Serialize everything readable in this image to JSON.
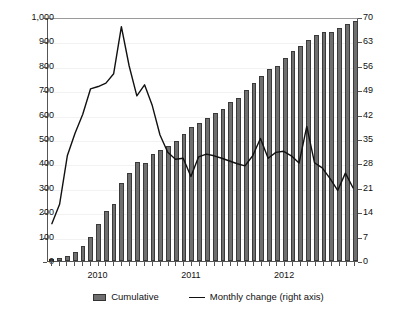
{
  "chart_data": {
    "type": "bar",
    "title": "",
    "subtitle": "",
    "xlabel": "",
    "ylabel": "",
    "y2label": "",
    "grid": true,
    "legend_position": "bottom",
    "ylim": [
      0,
      1000
    ],
    "y2lim": [
      0,
      70
    ],
    "yticks": [
      "0",
      "100",
      "200",
      "300",
      "400",
      "500",
      "600",
      "700",
      "800",
      "900",
      "1,000"
    ],
    "y2ticks": [
      "0",
      "7",
      "14",
      "21",
      "28",
      "35",
      "42",
      "49",
      "56",
      "63",
      "70"
    ],
    "xtick_labels": [
      "2010",
      "2011",
      "2012"
    ],
    "xtick_positions": [
      6.0,
      18.0,
      30.0
    ],
    "categories": [
      "2009-07",
      "2009-08",
      "2009-09",
      "2009-10",
      "2009-11",
      "2009-12",
      "2010-01",
      "2010-02",
      "2010-03",
      "2010-04",
      "2010-05",
      "2010-06",
      "2010-07",
      "2010-08",
      "2010-09",
      "2010-10",
      "2010-11",
      "2010-12",
      "2011-01",
      "2011-02",
      "2011-03",
      "2011-04",
      "2011-05",
      "2011-06",
      "2011-07",
      "2011-08",
      "2011-09",
      "2011-10",
      "2011-11",
      "2011-12",
      "2012-01",
      "2012-02",
      "2012-03",
      "2012-04",
      "2012-05",
      "2012-06",
      "2012-07",
      "2012-08",
      "2012-09",
      "2012-10"
    ],
    "series": [
      {
        "name": "Cumulative",
        "axis": "left",
        "kind": "bar",
        "values": [
          8,
          14,
          22,
          36,
          60,
          98,
          150,
          205,
          235,
          320,
          360,
          405,
          400,
          440,
          455,
          470,
          490,
          520,
          550,
          565,
          585,
          605,
          625,
          650,
          670,
          700,
          730,
          760,
          785,
          800,
          830,
          860,
          880,
          905,
          925,
          940,
          940,
          955,
          970,
          985
        ]
      },
      {
        "name": "Monthly change (right axis)",
        "axis": "right",
        "kind": "line",
        "values": [
          10.9,
          16.5,
          30.5,
          37.0,
          42.5,
          49.8,
          50.5,
          51.5,
          54.2,
          67.8,
          56.5,
          47.8,
          51.0,
          45.0,
          36.5,
          31.5,
          29.5,
          29.8,
          24.5,
          30.2,
          31.0,
          30.5,
          29.8,
          29.0,
          28.2,
          27.6,
          30.5,
          35.5,
          29.8,
          31.5,
          31.8,
          30.5,
          28.4,
          39.0,
          28.5,
          27.0,
          24.0,
          20.5,
          25.5,
          21.2
        ]
      }
    ],
    "legend": [
      {
        "label": "Cumulative",
        "marker": "bar"
      },
      {
        "label": "Monthly change (right axis)",
        "marker": "line"
      }
    ]
  }
}
